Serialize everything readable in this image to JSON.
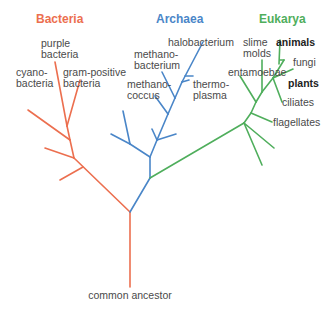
{
  "colors": {
    "bacteria": "#ec6f4f",
    "archaea": "#4a86c8",
    "eukarya": "#4fae5c",
    "text": "#4a4a4a"
  },
  "domains": {
    "bacteria": "Bacteria",
    "archaea": "Archaea",
    "eukarya": "Eukarya"
  },
  "root": {
    "label": "common ancestor"
  },
  "bacteria_leaves": {
    "purple": [
      "purple",
      "bacteria"
    ],
    "cyano": [
      "cyano-",
      "bacteria"
    ],
    "gram": [
      "gram-positive",
      "bacteria"
    ]
  },
  "archaea_leaves": {
    "halo": "halobacterium",
    "methanobacterium": [
      "methano-",
      "bacterium"
    ],
    "methanococcus": [
      "methano-",
      "coccus"
    ],
    "thermoplasma": [
      "thermo-",
      "plasma"
    ]
  },
  "eukarya_leaves": {
    "slime": [
      "slime",
      "molds"
    ],
    "animals": "animals",
    "fungi": "fungi",
    "plants": "plants",
    "entamoebae": "entamoebae",
    "ciliates": "ciliates",
    "flagellates": "flagellates"
  }
}
